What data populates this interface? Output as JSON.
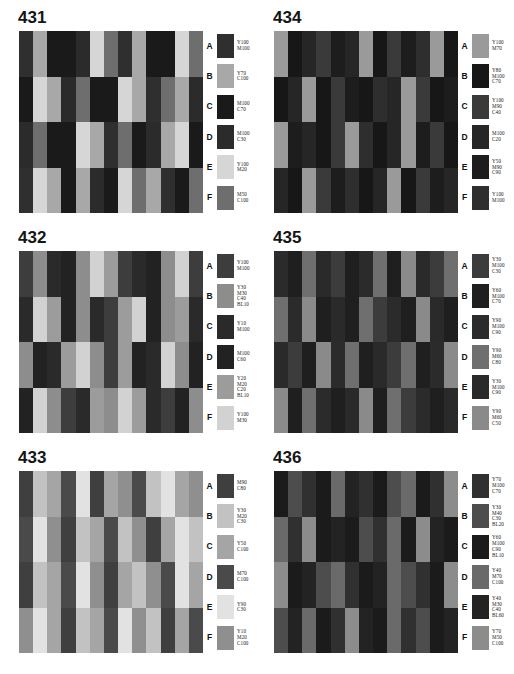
{
  "page": {
    "background": "#ffffff",
    "panel_count": 6
  },
  "legend_letters": [
    "A",
    "B",
    "C",
    "D",
    "E",
    "F"
  ],
  "panels": [
    {
      "number": "431",
      "legend": [
        {
          "letter": "A",
          "swatch": "#2f2f2f",
          "lines": [
            "Y100",
            "M100"
          ]
        },
        {
          "letter": "B",
          "swatch": "#a8a8a8",
          "lines": [
            "Y70",
            "C100"
          ]
        },
        {
          "letter": "C",
          "swatch": "#1a1a1a",
          "lines": [
            "M100",
            "C70"
          ]
        },
        {
          "letter": "D",
          "swatch": "#2b2b2b",
          "lines": [
            "M100",
            "C30"
          ]
        },
        {
          "letter": "E",
          "swatch": "#d6d6d6",
          "lines": [
            "Y100",
            "M20"
          ]
        },
        {
          "letter": "F",
          "swatch": "#6e6e6e",
          "lines": [
            "M50",
            "C100"
          ]
        }
      ],
      "grid": [
        [
          "#2f2f2f",
          "#a8a8a8",
          "#1a1a1a",
          "#1a1a1a",
          "#2b2b2b",
          "#d6d6d6",
          "#6e6e6e",
          "#2f2f2f",
          "#a8a8a8",
          "#1a1a1a",
          "#1a1a1a",
          "#d6d6d6",
          "#6e6e6e"
        ],
        [
          "#1a1a1a",
          "#d6d6d6",
          "#a8a8a8",
          "#2b2b2b",
          "#6e6e6e",
          "#1a1a1a",
          "#1a1a1a",
          "#d6d6d6",
          "#a8a8a8",
          "#2f2f2f",
          "#6e6e6e",
          "#a8a8a8",
          "#2b2b2b"
        ],
        [
          "#2b2b2b",
          "#6e6e6e",
          "#1a1a1a",
          "#1a1a1a",
          "#d6d6d6",
          "#a8a8a8",
          "#2f2f2f",
          "#6e6e6e",
          "#1a1a1a",
          "#2b2b2b",
          "#a8a8a8",
          "#d6d6d6",
          "#1a1a1a"
        ],
        [
          "#2f2f2f",
          "#d6d6d6",
          "#a8a8a8",
          "#1a1a1a",
          "#a8a8a8",
          "#2b2b2b",
          "#1a1a1a",
          "#d6d6d6",
          "#6e6e6e",
          "#a8a8a8",
          "#2f2f2f",
          "#1a1a1a",
          "#6e6e6e"
        ]
      ]
    },
    {
      "number": "434",
      "legend": [
        {
          "letter": "A",
          "swatch": "#9a9a9a",
          "lines": [
            "Y100",
            "M70"
          ]
        },
        {
          "letter": "B",
          "swatch": "#171717",
          "lines": [
            "Y80",
            "M100",
            "C70"
          ]
        },
        {
          "letter": "C",
          "swatch": "#3a3a3a",
          "lines": [
            "Y100",
            "M90",
            "C40"
          ]
        },
        {
          "letter": "D",
          "swatch": "#262626",
          "lines": [
            "M100",
            "C20"
          ]
        },
        {
          "letter": "E",
          "swatch": "#1d1d1d",
          "lines": [
            "Y50",
            "M90",
            "C90"
          ]
        },
        {
          "letter": "F",
          "swatch": "#2e2e2e",
          "lines": [
            "Y100",
            "M100"
          ]
        }
      ],
      "grid": [
        [
          "#9a9a9a",
          "#171717",
          "#262626",
          "#3a3a3a",
          "#1d1d1d",
          "#262626",
          "#9a9a9a",
          "#171717",
          "#3a3a3a",
          "#1d1d1d",
          "#2e2e2e",
          "#9a9a9a",
          "#171717"
        ],
        [
          "#171717",
          "#262626",
          "#9a9a9a",
          "#171717",
          "#3a3a3a",
          "#1d1d1d",
          "#171717",
          "#2e2e2e",
          "#262626",
          "#9a9a9a",
          "#3a3a3a",
          "#171717",
          "#1d1d1d"
        ],
        [
          "#9a9a9a",
          "#1d1d1d",
          "#262626",
          "#171717",
          "#3a3a3a",
          "#9a9a9a",
          "#2e2e2e",
          "#171717",
          "#262626",
          "#9a9a9a",
          "#1d1d1d",
          "#3a3a3a",
          "#171717"
        ],
        [
          "#262626",
          "#171717",
          "#9a9a9a",
          "#3a3a3a",
          "#1d1d1d",
          "#2e2e2e",
          "#171717",
          "#262626",
          "#9a9a9a",
          "#171717",
          "#3a3a3a",
          "#1d1d1d",
          "#262626"
        ]
      ]
    },
    {
      "number": "432",
      "legend": [
        {
          "letter": "A",
          "swatch": "#3d3d3d",
          "lines": [
            "Y100",
            "M100"
          ]
        },
        {
          "letter": "B",
          "swatch": "#8d8d8d",
          "lines": [
            "Y30",
            "M30",
            "C40",
            "BL10"
          ]
        },
        {
          "letter": "C",
          "swatch": "#2a2a2a",
          "lines": [
            "Y10",
            "M100"
          ]
        },
        {
          "letter": "D",
          "swatch": "#222222",
          "lines": [
            "M100",
            "C60"
          ]
        },
        {
          "letter": "E",
          "swatch": "#9c9c9c",
          "lines": [
            "Y20",
            "M20",
            "C20",
            "BL10"
          ]
        },
        {
          "letter": "F",
          "swatch": "#d2d2d2",
          "lines": [
            "Y100",
            "M30"
          ]
        }
      ],
      "grid": [
        [
          "#3d3d3d",
          "#8d8d8d",
          "#2a2a2a",
          "#222222",
          "#8d8d8d",
          "#d2d2d2",
          "#9c9c9c",
          "#3d3d3d",
          "#2a2a2a",
          "#222222",
          "#8d8d8d",
          "#d2d2d2",
          "#3d3d3d"
        ],
        [
          "#2a2a2a",
          "#d2d2d2",
          "#9c9c9c",
          "#222222",
          "#8d8d8d",
          "#2a2a2a",
          "#3d3d3d",
          "#9c9c9c",
          "#d2d2d2",
          "#222222",
          "#8d8d8d",
          "#9c9c9c",
          "#2a2a2a"
        ],
        [
          "#8d8d8d",
          "#222222",
          "#2a2a2a",
          "#9c9c9c",
          "#d2d2d2",
          "#8d8d8d",
          "#3d3d3d",
          "#9c9c9c",
          "#222222",
          "#2a2a2a",
          "#d2d2d2",
          "#8d8d8d",
          "#222222"
        ],
        [
          "#222222",
          "#d2d2d2",
          "#8d8d8d",
          "#3d3d3d",
          "#2a2a2a",
          "#9c9c9c",
          "#8d8d8d",
          "#d2d2d2",
          "#9c9c9c",
          "#2a2a2a",
          "#3d3d3d",
          "#222222",
          "#8d8d8d"
        ]
      ]
    },
    {
      "number": "435",
      "legend": [
        {
          "letter": "A",
          "swatch": "#3c3c3c",
          "lines": [
            "Y30",
            "M100",
            "C30"
          ]
        },
        {
          "letter": "B",
          "swatch": "#1f1f1f",
          "lines": [
            "Y60",
            "M100",
            "C70"
          ]
        },
        {
          "letter": "C",
          "swatch": "#2b2b2b",
          "lines": [
            "Y90",
            "M100",
            "C90"
          ]
        },
        {
          "letter": "D",
          "swatch": "#6f6f6f",
          "lines": [
            "Y90",
            "M60",
            "C80"
          ]
        },
        {
          "letter": "E",
          "swatch": "#2a2a2a",
          "lines": [
            "Y30",
            "M100",
            "C90"
          ]
        },
        {
          "letter": "F",
          "swatch": "#8a8a8a",
          "lines": [
            "Y90",
            "M60",
            "C50"
          ]
        }
      ],
      "grid": [
        [
          "#2b2b2b",
          "#1f1f1f",
          "#6f6f6f",
          "#2a2a2a",
          "#3c3c3c",
          "#1f1f1f",
          "#2b2b2b",
          "#6f6f6f",
          "#1f1f1f",
          "#8a8a8a",
          "#2a2a2a",
          "#3c3c3c",
          "#6f6f6f"
        ],
        [
          "#6f6f6f",
          "#2b2b2b",
          "#8a8a8a",
          "#1f1f1f",
          "#2a2a2a",
          "#1f1f1f",
          "#6f6f6f",
          "#3c3c3c",
          "#2b2b2b",
          "#1f1f1f",
          "#8a8a8a",
          "#2a2a2a",
          "#1f1f1f"
        ],
        [
          "#2a2a2a",
          "#3c3c3c",
          "#1f1f1f",
          "#8a8a8a",
          "#2b2b2b",
          "#6f6f6f",
          "#1f1f1f",
          "#2a2a2a",
          "#3c3c3c",
          "#6f6f6f",
          "#1f1f1f",
          "#2b2b2b",
          "#8a8a8a"
        ],
        [
          "#8a8a8a",
          "#1f1f1f",
          "#6f6f6f",
          "#2b2b2b",
          "#1f1f1f",
          "#2a2a2a",
          "#8a8a8a",
          "#1f1f1f",
          "#6f6f6f",
          "#3c3c3c",
          "#2b2b2b",
          "#1f1f1f",
          "#2a2a2a"
        ]
      ]
    },
    {
      "number": "433",
      "legend": [
        {
          "letter": "A",
          "swatch": "#3f3f3f",
          "lines": [
            "M90",
            "C80"
          ]
        },
        {
          "letter": "B",
          "swatch": "#c2c2c2",
          "lines": [
            "Y30",
            "M20",
            "C30"
          ]
        },
        {
          "letter": "C",
          "swatch": "#a5a5a5",
          "lines": [
            "Y50",
            "C100"
          ]
        },
        {
          "letter": "D",
          "swatch": "#4a4a4a",
          "lines": [
            "M70",
            "C100"
          ]
        },
        {
          "letter": "E",
          "swatch": "#e2e2e2",
          "lines": [
            "Y90",
            "C30"
          ]
        },
        {
          "letter": "F",
          "swatch": "#8f8f8f",
          "lines": [
            "Y10",
            "M20",
            "C100"
          ]
        }
      ],
      "grid": [
        [
          "#3f3f3f",
          "#c2c2c2",
          "#a5a5a5",
          "#4a4a4a",
          "#e2e2e2",
          "#3f3f3f",
          "#a5a5a5",
          "#8f8f8f",
          "#4a4a4a",
          "#c2c2c2",
          "#e2e2e2",
          "#a5a5a5",
          "#8f8f8f"
        ],
        [
          "#4a4a4a",
          "#e2e2e2",
          "#8f8f8f",
          "#3f3f3f",
          "#c2c2c2",
          "#a5a5a5",
          "#4a4a4a",
          "#c2c2c2",
          "#8f8f8f",
          "#3f3f3f",
          "#a5a5a5",
          "#e2e2e2",
          "#c2c2c2"
        ],
        [
          "#3f3f3f",
          "#c2c2c2",
          "#a5a5a5",
          "#4a4a4a",
          "#e2e2e2",
          "#8f8f8f",
          "#3f3f3f",
          "#a5a5a5",
          "#c2c2c2",
          "#8f8f8f",
          "#4a4a4a",
          "#e2e2e2",
          "#a5a5a5"
        ],
        [
          "#8f8f8f",
          "#e2e2e2",
          "#a5a5a5",
          "#3f3f3f",
          "#c2c2c2",
          "#a5a5a5",
          "#4a4a4a",
          "#e2e2e2",
          "#8f8f8f",
          "#c2c2c2",
          "#3f3f3f",
          "#a5a5a5",
          "#4a4a4a"
        ]
      ]
    },
    {
      "number": "436",
      "legend": [
        {
          "letter": "A",
          "swatch": "#303030",
          "lines": [
            "Y70",
            "M100",
            "C70"
          ]
        },
        {
          "letter": "B",
          "swatch": "#4d4d4d",
          "lines": [
            "Y30",
            "M40",
            "C30",
            "BL20"
          ]
        },
        {
          "letter": "C",
          "swatch": "#1b1b1b",
          "lines": [
            "Y60",
            "M100",
            "C90",
            "BL10"
          ]
        },
        {
          "letter": "D",
          "swatch": "#6a6a6a",
          "lines": [
            "Y40",
            "M70",
            "C100"
          ]
        },
        {
          "letter": "E",
          "swatch": "#232323",
          "lines": [
            "Y40",
            "M30",
            "C40",
            "BL60"
          ]
        },
        {
          "letter": "F",
          "swatch": "#8c8c8c",
          "lines": [
            "Y70",
            "M50",
            "C100"
          ]
        }
      ],
      "grid": [
        [
          "#1b1b1b",
          "#4d4d4d",
          "#303030",
          "#1b1b1b",
          "#6a6a6a",
          "#232323",
          "#303030",
          "#1b1b1b",
          "#4d4d4d",
          "#6a6a6a",
          "#1b1b1b",
          "#303030",
          "#8c8c8c"
        ],
        [
          "#6a6a6a",
          "#303030",
          "#8c8c8c",
          "#1b1b1b",
          "#232323",
          "#1b1b1b",
          "#4d4d4d",
          "#303030",
          "#6a6a6a",
          "#1b1b1b",
          "#8c8c8c",
          "#232323",
          "#1b1b1b"
        ],
        [
          "#8c8c8c",
          "#1b1b1b",
          "#232323",
          "#4d4d4d",
          "#6a6a6a",
          "#303030",
          "#1b1b1b",
          "#232323",
          "#6a6a6a",
          "#4d4d4d",
          "#303030",
          "#1b1b1b",
          "#8c8c8c"
        ],
        [
          "#4d4d4d",
          "#232323",
          "#6a6a6a",
          "#1b1b1b",
          "#303030",
          "#8c8c8c",
          "#232323",
          "#1b1b1b",
          "#6a6a6a",
          "#303030",
          "#4d4d4d",
          "#1b1b1b",
          "#232323"
        ]
      ]
    }
  ]
}
